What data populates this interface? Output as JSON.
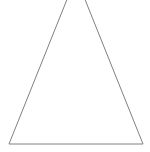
{
  "canvas": {
    "width": 150,
    "height": 152,
    "background_color": "#ffffff",
    "title": "Triangle Line Drawing"
  },
  "figure": {
    "name": "triangle",
    "stroke_color": "#808080",
    "stroke_width": 1,
    "fill": "none",
    "clipped_at_top": true,
    "vertices": [
      {
        "name": "apex",
        "x": 76,
        "y": -23,
        "visible": false
      },
      {
        "name": "bottom-right",
        "x": 143,
        "y": 144,
        "visible": true
      },
      {
        "name": "bottom-left",
        "x": 9,
        "y": 144,
        "visible": true
      }
    ],
    "points_path": "76,-23 143,144 9,144",
    "edges": [
      {
        "name": "left-edge",
        "from": "apex",
        "to": "bottom-left",
        "x1": 76,
        "y1": -23,
        "x2": 9,
        "y2": 144
      },
      {
        "name": "right-edge",
        "from": "apex",
        "to": "bottom-right",
        "x1": 76,
        "y1": -23,
        "x2": 143,
        "y2": 144
      },
      {
        "name": "base-edge",
        "from": "bottom-left",
        "to": "bottom-right",
        "x1": 9,
        "y1": 144,
        "x2": 143,
        "y2": 144
      }
    ],
    "measurements": {
      "base_width_px": 134,
      "visible_height_px": 144,
      "base_y_px": 144
    }
  }
}
